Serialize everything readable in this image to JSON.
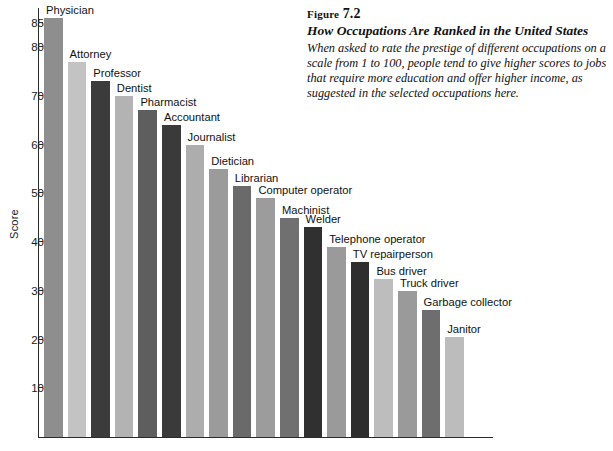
{
  "caption": {
    "figure_word": "Figure",
    "figure_number": "7.2",
    "title": "How Occupations Are Ranked in the United States",
    "body": "When asked to rate the prestige of different occupations on a scale from 1 to 100, people tend to give higher scores to jobs that require more education and offer higher income, as suggested in the selected occupations here."
  },
  "chart_data": {
    "type": "bar",
    "title": "How Occupations Are Ranked in the United States",
    "xlabel": "",
    "ylabel": "Score",
    "ylim": [
      0,
      88
    ],
    "grid": false,
    "legend": null,
    "ticks": [
      10,
      20,
      30,
      40,
      50,
      60,
      70,
      80,
      85
    ],
    "tick_labels": [
      "10",
      "20",
      "30",
      "40",
      "50",
      "60",
      "70",
      "80",
      "85"
    ],
    "categories": [
      "Physician",
      "Attorney",
      "Professor",
      "Dentist",
      "Pharmacist",
      "Accountant",
      "Journalist",
      "Dietician",
      "Librarian",
      "Computer operator",
      "Machinist",
      "Welder",
      "Telephone operator",
      "TV repairperson",
      "Bus driver",
      "Truck driver",
      "Garbage collector",
      "Janitor"
    ],
    "values": [
      86,
      77,
      73,
      70,
      67,
      64,
      60,
      55,
      51.5,
      49,
      45,
      43,
      39,
      36,
      32.5,
      30,
      26,
      20.5
    ],
    "colors": [
      "#8e8e8e",
      "#c3c3c3",
      "#3b3b3b",
      "#b3b3b3",
      "#5e5e5e",
      "#3a3a3a",
      "#adadad",
      "#9b9b9b",
      "#6a6a6a",
      "#9c9c9c",
      "#707070",
      "#303030",
      "#9a9a9a",
      "#2e2e2e",
      "#bdbdbd",
      "#9a9a9a",
      "#6e6e6e",
      "#bcbcbc"
    ]
  }
}
